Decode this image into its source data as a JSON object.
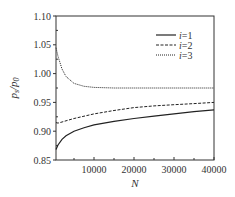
{
  "chart_data": {
    "type": "line",
    "title": "",
    "xlabel": "N",
    "ylabel": "p_s/p_0",
    "xlim": [
      500,
      40000
    ],
    "ylim": [
      0.85,
      1.1
    ],
    "grid": false,
    "legend_position": "upper right",
    "x_ticks": [
      10000,
      20000,
      30000,
      40000
    ],
    "x_tick_labels": [
      "10000",
      "20000",
      "30000",
      "40000"
    ],
    "x_minor_ticks": [
      5000,
      15000,
      25000,
      35000
    ],
    "y_ticks": [
      0.85,
      0.9,
      0.95,
      1.0,
      1.05,
      1.1
    ],
    "y_tick_labels": [
      "0.85",
      "0.90",
      "0.95",
      "1.00",
      "1.05",
      "1.10"
    ],
    "x": [
      500,
      1000,
      2000,
      3000,
      5000,
      7500,
      10000,
      15000,
      20000,
      25000,
      30000,
      35000,
      40000
    ],
    "series": [
      {
        "name": "i=1",
        "style": "solid",
        "values": [
          0.868,
          0.876,
          0.886,
          0.892,
          0.9,
          0.906,
          0.911,
          0.917,
          0.922,
          0.926,
          0.93,
          0.934,
          0.937
        ]
      },
      {
        "name": "i=2",
        "style": "dashed",
        "values": [
          0.915,
          0.914,
          0.916,
          0.918,
          0.922,
          0.926,
          0.93,
          0.936,
          0.941,
          0.944,
          0.946,
          0.948,
          0.95
        ]
      },
      {
        "name": "i=3",
        "style": "dotted",
        "values": [
          1.045,
          1.03,
          1.008,
          0.995,
          0.983,
          0.978,
          0.976,
          0.975,
          0.975,
          0.975,
          0.975,
          0.975,
          0.975
        ]
      }
    ]
  },
  "labels": {
    "xlabel": "N",
    "ylabel_main": "p",
    "ylabel_sub1": "s",
    "ylabel_slash": "/",
    "ylabel_sub2": "0"
  },
  "legend": [
    {
      "label": "i=1",
      "style": "solid"
    },
    {
      "label": "i=2",
      "style": "dashed"
    },
    {
      "label": "i=3",
      "style": "dotted"
    }
  ],
  "colors": {
    "line": "#222222",
    "axis": "#333333"
  }
}
